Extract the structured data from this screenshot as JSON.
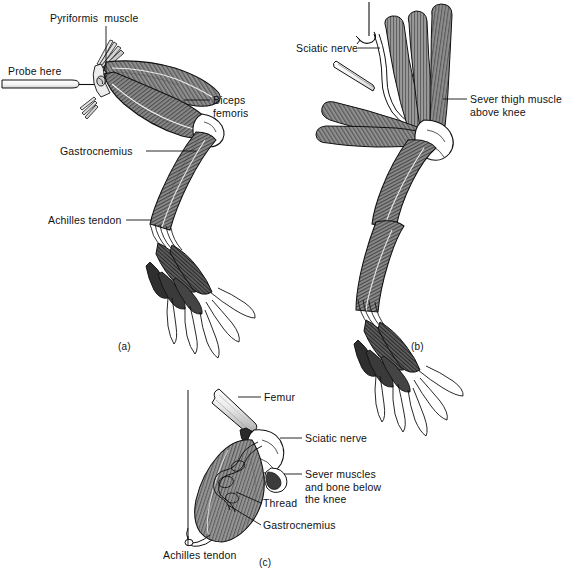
{
  "figure": {
    "background_color": "#ffffff",
    "ink_color": "#111111",
    "muscle_fill": "#8a8a8a",
    "muscle_fill_dark": "#4a4a4a",
    "bone_fill": "#f2f2f2"
  },
  "panels": [
    {
      "id": "a",
      "caption": "(a)",
      "caption_pos": {
        "x": 122,
        "y": 342
      },
      "labels": [
        {
          "name": "pyriformis-muscle",
          "text": "Pyriformis  muscle",
          "x": 50,
          "y": 18,
          "align": "left"
        },
        {
          "name": "probe-here",
          "text": "Probe here",
          "x": 8,
          "y": 72,
          "align": "left"
        },
        {
          "name": "biceps-femoris",
          "text": "Biceps\nfemoris",
          "x": 213,
          "y": 95,
          "align": "left"
        },
        {
          "name": "gastrocnemius",
          "text": "Gastrocnemius",
          "x": 60,
          "y": 145,
          "align": "left"
        },
        {
          "name": "achilles-tendon",
          "text": "Achilles tendon",
          "x": 48,
          "y": 214,
          "align": "left"
        }
      ]
    },
    {
      "id": "b",
      "caption": "(b)",
      "caption_pos": {
        "x": 415,
        "y": 342
      },
      "labels": [
        {
          "name": "sciatic-nerve",
          "text": "Sciatic nerve",
          "x": 296,
          "y": 43,
          "align": "left"
        },
        {
          "name": "sever-thigh-muscle-above-knee",
          "text": "Sever thigh muscle\nabove knee",
          "x": 470,
          "y": 94,
          "align": "left"
        }
      ]
    },
    {
      "id": "c",
      "caption": "(c)",
      "caption_pos": {
        "x": 263,
        "y": 558
      },
      "labels": [
        {
          "name": "femur",
          "text": "Femur",
          "x": 264,
          "y": 391,
          "align": "left"
        },
        {
          "name": "sciatic-nerve",
          "text": "Sciatic nerve",
          "x": 305,
          "y": 432,
          "align": "left"
        },
        {
          "name": "sever-muscles-and-bone-below-the-knee",
          "text": "Sever muscles\nand bone below\nthe knee",
          "x": 305,
          "y": 468,
          "align": "left"
        },
        {
          "name": "thread",
          "text": "Thread",
          "x": 263,
          "y": 498,
          "align": "left"
        },
        {
          "name": "gastrocnemius",
          "text": "Gastrocnemius",
          "x": 263,
          "y": 520,
          "align": "left"
        },
        {
          "name": "achilles-tendon",
          "text": "Achilles tendon",
          "x": 163,
          "y": 541,
          "align": "left"
        }
      ]
    }
  ]
}
